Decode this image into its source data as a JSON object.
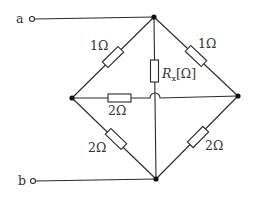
{
  "diagram": {
    "type": "circuit",
    "terminals": [
      {
        "id": "a",
        "label": "a"
      },
      {
        "id": "b",
        "label": "b"
      }
    ],
    "resistors": [
      {
        "id": "r-top-left",
        "label": "1Ω",
        "value": "1",
        "unit": "Ω",
        "from": "left-node",
        "to": "top-node"
      },
      {
        "id": "r-top-right",
        "label": "1Ω",
        "value": "1",
        "unit": "Ω",
        "from": "top-node",
        "to": "right-node"
      },
      {
        "id": "r-x",
        "label_main": "R",
        "label_sub": "x",
        "label_unit": "[Ω]",
        "from": "top-node",
        "to": "bottom-node"
      },
      {
        "id": "r-middle",
        "label": "2Ω",
        "value": "2",
        "unit": "Ω",
        "from": "left-node",
        "to": "right-node"
      },
      {
        "id": "r-bottom-left",
        "label": "2Ω",
        "value": "2",
        "unit": "Ω",
        "from": "left-node",
        "to": "bottom-node"
      },
      {
        "id": "r-bottom-right",
        "label": "2Ω",
        "value": "2",
        "unit": "Ω",
        "from": "right-node",
        "to": "bottom-node"
      }
    ],
    "nodes": [
      "top-node",
      "left-node",
      "right-node",
      "bottom-node"
    ]
  }
}
